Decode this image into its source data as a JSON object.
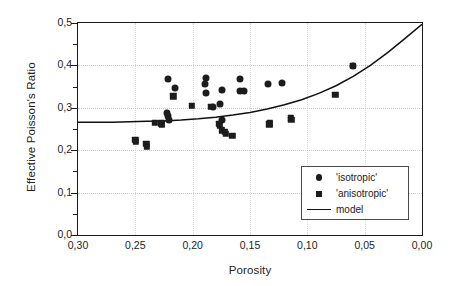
{
  "chart_data": {
    "type": "scatter",
    "title": "",
    "xlabel": "Porosity",
    "ylabel": "Effective Poisson's Ratio",
    "xlim": [
      0.3,
      0.0
    ],
    "ylim": [
      0.0,
      0.5
    ],
    "x_reversed": true,
    "grid": "dotted-faint",
    "legend_position": "lower-right-inside",
    "xticks": [
      "0,30",
      "0,25",
      "0,20",
      "0,15",
      "0,10",
      "0,05",
      "0,00"
    ],
    "xtick_values": [
      0.3,
      0.25,
      0.2,
      0.15,
      0.1,
      0.05,
      0.0
    ],
    "xminor_values": [
      0.275,
      0.225,
      0.175,
      0.125,
      0.075,
      0.025
    ],
    "yticks": [
      "0,0",
      "0,1",
      "0,2",
      "0,3",
      "0,4",
      "0,5"
    ],
    "ytick_values": [
      0.0,
      0.1,
      0.2,
      0.3,
      0.4,
      0.5
    ],
    "yminor_values": [
      0.05,
      0.15,
      0.25,
      0.35,
      0.45
    ],
    "decimal_separator": ",",
    "series": [
      {
        "name": "'isotropic'",
        "marker": "circle",
        "color": "#1c1c1c",
        "points": [
          {
            "x": 0.2215,
            "y": 0.368
          },
          {
            "x": 0.2155,
            "y": 0.346
          },
          {
            "x": 0.2225,
            "y": 0.288
          },
          {
            "x": 0.2215,
            "y": 0.281
          },
          {
            "x": 0.2205,
            "y": 0.272
          },
          {
            "x": 0.1885,
            "y": 0.371
          },
          {
            "x": 0.189,
            "y": 0.357
          },
          {
            "x": 0.188,
            "y": 0.336
          },
          {
            "x": 0.182,
            "y": 0.303
          },
          {
            "x": 0.1745,
            "y": 0.342
          },
          {
            "x": 0.176,
            "y": 0.309
          },
          {
            "x": 0.1745,
            "y": 0.272
          },
          {
            "x": 0.159,
            "y": 0.369
          },
          {
            "x": 0.1585,
            "y": 0.34
          },
          {
            "x": 0.1555,
            "y": 0.34
          },
          {
            "x": 0.1345,
            "y": 0.357
          },
          {
            "x": 0.122,
            "y": 0.359
          },
          {
            "x": 0.0605,
            "y": 0.399
          }
        ]
      },
      {
        "name": "'anisotropic'",
        "marker": "square",
        "color": "#1c1c1c",
        "points": [
          {
            "x": 0.25,
            "y": 0.224
          },
          {
            "x": 0.2495,
            "y": 0.22
          },
          {
            "x": 0.2405,
            "y": 0.215
          },
          {
            "x": 0.24,
            "y": 0.208
          },
          {
            "x": 0.233,
            "y": 0.264
          },
          {
            "x": 0.2275,
            "y": 0.263
          },
          {
            "x": 0.227,
            "y": 0.261
          },
          {
            "x": 0.217,
            "y": 0.327
          },
          {
            "x": 0.201,
            "y": 0.304
          },
          {
            "x": 0.184,
            "y": 0.303
          },
          {
            "x": 0.177,
            "y": 0.262
          },
          {
            "x": 0.1765,
            "y": 0.257
          },
          {
            "x": 0.1745,
            "y": 0.247
          },
          {
            "x": 0.172,
            "y": 0.243
          },
          {
            "x": 0.171,
            "y": 0.238
          },
          {
            "x": 0.1655,
            "y": 0.234
          },
          {
            "x": 0.133,
            "y": 0.261
          },
          {
            "x": 0.1325,
            "y": 0.263
          },
          {
            "x": 0.1145,
            "y": 0.275
          },
          {
            "x": 0.114,
            "y": 0.272
          },
          {
            "x": 0.0755,
            "y": 0.331
          },
          {
            "x": 0.0605,
            "y": 0.399
          }
        ]
      }
    ],
    "model_curve": {
      "name": "model",
      "style": "solid",
      "color": "#111111",
      "points": [
        {
          "x": 0.3,
          "y": 0.266
        },
        {
          "x": 0.285,
          "y": 0.266
        },
        {
          "x": 0.27,
          "y": 0.266
        },
        {
          "x": 0.255,
          "y": 0.267
        },
        {
          "x": 0.24,
          "y": 0.268
        },
        {
          "x": 0.225,
          "y": 0.269
        },
        {
          "x": 0.21,
          "y": 0.271
        },
        {
          "x": 0.195,
          "y": 0.274
        },
        {
          "x": 0.18,
          "y": 0.278
        },
        {
          "x": 0.165,
          "y": 0.283
        },
        {
          "x": 0.15,
          "y": 0.289
        },
        {
          "x": 0.135,
          "y": 0.297
        },
        {
          "x": 0.12,
          "y": 0.307
        },
        {
          "x": 0.105,
          "y": 0.319
        },
        {
          "x": 0.09,
          "y": 0.334
        },
        {
          "x": 0.075,
          "y": 0.352
        },
        {
          "x": 0.06,
          "y": 0.374
        },
        {
          "x": 0.045,
          "y": 0.4
        },
        {
          "x": 0.03,
          "y": 0.43
        },
        {
          "x": 0.015,
          "y": 0.463
        },
        {
          "x": 0.0,
          "y": 0.497
        }
      ]
    },
    "legend": [
      {
        "label": "'isotropic'",
        "key": "circle"
      },
      {
        "label": "'anisotropic'",
        "key": "square"
      },
      {
        "label": "model",
        "key": "line"
      }
    ]
  }
}
